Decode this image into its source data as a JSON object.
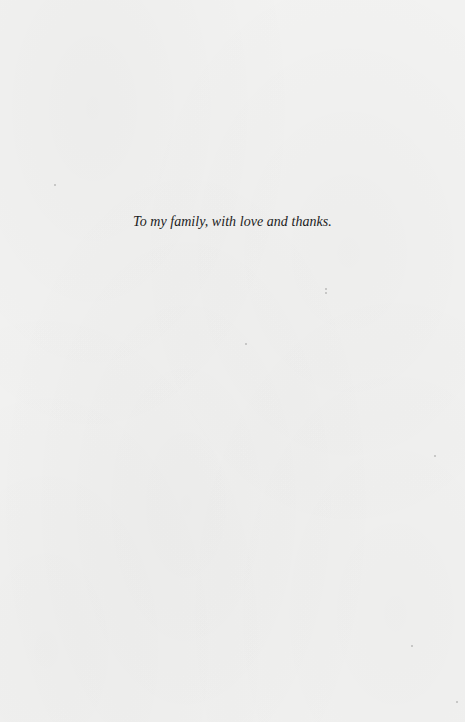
{
  "page": {
    "dedication": "To my family, with love and thanks.",
    "background_color": "#f2f2f1",
    "text_color": "#1c1c1c"
  }
}
